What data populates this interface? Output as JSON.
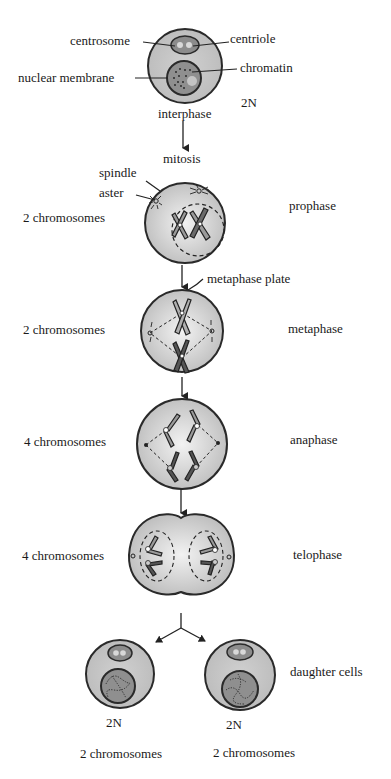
{
  "diagram": {
    "title": "Mitosis",
    "colors": {
      "cell_fill": "#c8c8c8",
      "cell_center": "#f0f0f0",
      "nucleus_fill": "#8f8f8f",
      "outline": "#2a2a2a"
    },
    "interphase": {
      "stage_label": "interphase",
      "ploidy": "2N",
      "labels": {
        "centrosome": "centrosome",
        "centriole": "centriole",
        "nuclear_membrane": "nuclear membrane",
        "chromatin": "chromatin"
      }
    },
    "arrow_label": "mitosis",
    "stages": [
      {
        "name": "prophase",
        "count": "2 chromosomes",
        "labels": {
          "spindle": "spindle",
          "aster": "aster"
        }
      },
      {
        "name": "metaphase",
        "count": "2 chromosomes",
        "labels": {
          "metaphase_plate": "metaphase plate"
        }
      },
      {
        "name": "anaphase",
        "count": "4 chromosomes"
      },
      {
        "name": "telophase",
        "count": "4 chromosomes"
      }
    ],
    "daughter_cells": {
      "label": "daughter cells",
      "cells": [
        {
          "ploidy": "2N",
          "count": "2 chromosomes"
        },
        {
          "ploidy": "2N",
          "count": "2 chromosomes"
        }
      ]
    }
  }
}
